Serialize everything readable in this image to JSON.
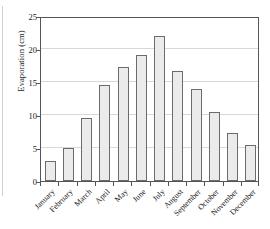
{
  "chart_data": {
    "type": "bar",
    "title": "",
    "xlabel": "",
    "ylabel": "Evaporation (cm)",
    "ylim": [
      0,
      25
    ],
    "yticks": [
      0,
      5,
      10,
      15,
      20,
      25
    ],
    "grid": true,
    "legend": false,
    "categories": [
      "January",
      "February",
      "March",
      "April",
      "May",
      "June",
      "July",
      "August",
      "September",
      "October",
      "November",
      "December"
    ],
    "values": [
      3.0,
      5.0,
      9.5,
      14.6,
      17.3,
      19.1,
      21.9,
      16.6,
      13.9,
      10.5,
      7.3,
      5.4
    ],
    "bar_fill_color": "#ebebeb",
    "bar_edge_color": "#6b6b6b",
    "gridline_color": "#d8d8d8",
    "axis_color": "#555555"
  }
}
